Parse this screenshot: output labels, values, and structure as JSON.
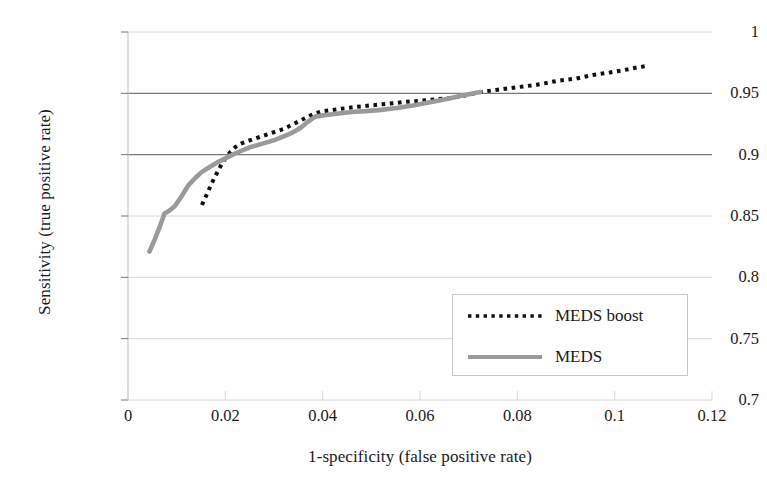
{
  "chart_data": {
    "type": "line",
    "title": "",
    "xlabel": "1-specificity (false positive rate)",
    "ylabel": "Sensitivity (true positive rate)",
    "xlim": [
      0,
      0.12
    ],
    "ylim": [
      0.7,
      1
    ],
    "xticks": [
      "0",
      "0.02",
      "0.04",
      "0.06",
      "0.08",
      "0.1",
      "0.12"
    ],
    "xtick_values": [
      0,
      0.02,
      0.04,
      0.06,
      0.08,
      0.1,
      0.12
    ],
    "yticks": [
      "0.7",
      "0.75",
      "0.8",
      "0.85",
      "0.9",
      "0.95",
      "1"
    ],
    "ytick_values": [
      0.7,
      0.75,
      0.8,
      0.85,
      0.9,
      0.95,
      1
    ],
    "grid": true,
    "legend_position": "lower right",
    "series": [
      {
        "name": "MEDS boost",
        "style": "dotted",
        "color": "#111111",
        "points": [
          [
            0.0152,
            0.859
          ],
          [
            0.016,
            0.866
          ],
          [
            0.0168,
            0.873
          ],
          [
            0.0176,
            0.88
          ],
          [
            0.0184,
            0.886
          ],
          [
            0.0192,
            0.892
          ],
          [
            0.02,
            0.897
          ],
          [
            0.021,
            0.902
          ],
          [
            0.022,
            0.906
          ],
          [
            0.0232,
            0.909
          ],
          [
            0.0245,
            0.911
          ],
          [
            0.026,
            0.913
          ],
          [
            0.0275,
            0.915
          ],
          [
            0.029,
            0.917
          ],
          [
            0.0305,
            0.919
          ],
          [
            0.032,
            0.921
          ],
          [
            0.0335,
            0.924
          ],
          [
            0.035,
            0.927
          ],
          [
            0.0365,
            0.93
          ],
          [
            0.038,
            0.933
          ],
          [
            0.0395,
            0.935
          ],
          [
            0.0412,
            0.936
          ],
          [
            0.043,
            0.937
          ],
          [
            0.045,
            0.938
          ],
          [
            0.047,
            0.939
          ],
          [
            0.0495,
            0.94
          ],
          [
            0.052,
            0.941
          ],
          [
            0.0545,
            0.942
          ],
          [
            0.057,
            0.943
          ],
          [
            0.06,
            0.944
          ],
          [
            0.063,
            0.945
          ],
          [
            0.066,
            0.946
          ],
          [
            0.069,
            0.948
          ],
          [
            0.0724,
            0.951
          ],
          [
            0.076,
            0.953
          ],
          [
            0.08,
            0.955
          ],
          [
            0.084,
            0.957
          ],
          [
            0.088,
            0.96
          ],
          [
            0.092,
            0.962
          ],
          [
            0.0955,
            0.965
          ],
          [
            0.099,
            0.967
          ],
          [
            0.102,
            0.969
          ],
          [
            0.1045,
            0.971
          ],
          [
            0.107,
            0.9725
          ]
        ]
      },
      {
        "name": "MEDS",
        "style": "solid",
        "color": "#9a9a9a",
        "points": [
          [
            0.0044,
            0.821
          ],
          [
            0.0055,
            0.831
          ],
          [
            0.0066,
            0.842
          ],
          [
            0.0075,
            0.852
          ],
          [
            0.0084,
            0.854
          ],
          [
            0.0096,
            0.858
          ],
          [
            0.011,
            0.866
          ],
          [
            0.0124,
            0.875
          ],
          [
            0.0138,
            0.881
          ],
          [
            0.0152,
            0.886
          ],
          [
            0.0168,
            0.89
          ],
          [
            0.0185,
            0.894
          ],
          [
            0.02,
            0.897
          ],
          [
            0.0215,
            0.9
          ],
          [
            0.0232,
            0.903
          ],
          [
            0.025,
            0.906
          ],
          [
            0.0268,
            0.908
          ],
          [
            0.0285,
            0.91
          ],
          [
            0.0302,
            0.912
          ],
          [
            0.032,
            0.915
          ],
          [
            0.0338,
            0.918
          ],
          [
            0.0355,
            0.922
          ],
          [
            0.037,
            0.927
          ],
          [
            0.0385,
            0.931
          ],
          [
            0.04,
            0.932
          ],
          [
            0.042,
            0.933
          ],
          [
            0.0442,
            0.934
          ],
          [
            0.0465,
            0.935
          ],
          [
            0.049,
            0.9355
          ],
          [
            0.052,
            0.9365
          ],
          [
            0.0552,
            0.938
          ],
          [
            0.0585,
            0.94
          ],
          [
            0.0618,
            0.9425
          ],
          [
            0.065,
            0.945
          ],
          [
            0.0685,
            0.948
          ],
          [
            0.0724,
            0.951
          ]
        ]
      }
    ]
  },
  "legend": {
    "items": [
      {
        "label": "MEDS boost",
        "style": "dotted"
      },
      {
        "label": "MEDS",
        "style": "solid"
      }
    ]
  },
  "colors": {
    "meds_boost": "#111111",
    "meds": "#9a9a9a",
    "grid_major": "#7a7a7a",
    "grid_minor": "#d8d8d8",
    "axis": "#c9c9c9",
    "text": "#1a1a1a"
  }
}
